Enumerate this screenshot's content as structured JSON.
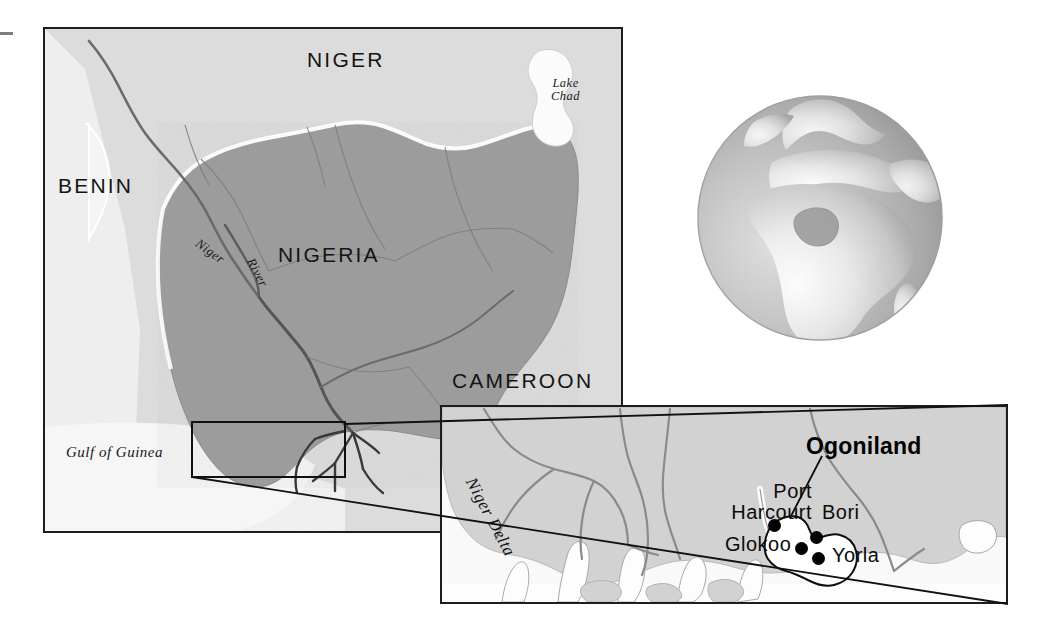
{
  "figure": {
    "kind": "reference-map",
    "width": 1054,
    "height": 639,
    "background": "#ffffff"
  },
  "colors": {
    "highlight_country_fill": "#9a9a9a",
    "neighbor_land_fill": "#d9d9d9",
    "water_fill": "#f4f4f4",
    "inset_land_fill": "#d2d2d2",
    "inset_water_fill": "#ffffff",
    "frame_stroke": "#1d1d1d",
    "border_stroke": "#6f6f6f",
    "river_stroke": "#555555",
    "coast_stroke": "#ffffff",
    "marker_fill": "#000000",
    "globe_ocean": "#a8a8a8",
    "globe_land": "#dcdcdc",
    "globe_highlight": "#8f8f8f"
  },
  "main_map": {
    "name": "nigeria-regional-map",
    "frame": {
      "x": 43,
      "y": 27,
      "w": 580,
      "h": 506
    },
    "country_labels": [
      {
        "id": "niger",
        "text": "NIGER",
        "x": 307,
        "y": 56
      },
      {
        "id": "benin",
        "text": "BENIN",
        "x": 58,
        "y": 182
      },
      {
        "id": "nigeria",
        "text": "NIGERIA",
        "x": 278,
        "y": 251
      },
      {
        "id": "cameroon",
        "text": "CAMEROON",
        "x": 452,
        "y": 377
      }
    ],
    "water_labels": [
      {
        "id": "lake-chad",
        "text": "Lake\nChad",
        "x": 551,
        "y": 80
      },
      {
        "id": "gulf-of-guinea",
        "text": "Gulf of Guinea",
        "x": 66,
        "y": 452
      }
    ],
    "river_labels": [
      {
        "id": "niger-word",
        "text": "Niger",
        "x": 197,
        "y": 241,
        "rotate": 36
      },
      {
        "id": "river-word",
        "text": "River",
        "x": 250,
        "y": 258,
        "rotate": 62
      }
    ],
    "inset_selection_box": {
      "x": 192,
      "y": 422,
      "w": 153,
      "h": 55
    }
  },
  "globe": {
    "name": "locator-globe",
    "frame": {
      "x": 694,
      "y": 92,
      "d": 252
    },
    "highlight_region": "Nigeria",
    "view": "Africa, Europe and Middle East"
  },
  "inset_map": {
    "name": "niger-delta-ogoniland-inset",
    "frame": {
      "x": 440,
      "y": 405,
      "w": 568,
      "h": 199
    },
    "region_label": {
      "id": "ogoniland",
      "text": "Ogoniland",
      "x": 806,
      "y": 445
    },
    "delta_label": {
      "id": "niger-delta",
      "text": "Niger Delta",
      "x": 470,
      "y": 478,
      "rotate": 62
    },
    "places": [
      {
        "id": "port-harcourt",
        "text": "Port\nHarcourt",
        "label_x": 672,
        "label_y": 487,
        "dot_x": 770,
        "dot_y": 521,
        "dot_r": 6
      },
      {
        "id": "bori",
        "text": "Bori",
        "label_x": 820,
        "label_y": 506,
        "dot_x": 812,
        "dot_y": 535,
        "dot_r": 6
      },
      {
        "id": "glokoo",
        "text": "Glokoo",
        "label_x": 727,
        "label_y": 538,
        "dot_x": 797,
        "dot_y": 546,
        "dot_r": 6
      },
      {
        "id": "yorla",
        "text": "Yorla",
        "label_x": 830,
        "label_y": 549,
        "dot_x": 814,
        "dot_y": 556,
        "dot_r": 6
      }
    ],
    "leader_line": {
      "from_x": 822,
      "from_y": 456,
      "to_x": 790,
      "to_y": 518
    }
  },
  "connector_lines": [
    {
      "id": "connector-top",
      "x1": 345,
      "y1": 424,
      "x2": 1008,
      "y2": 405
    },
    {
      "id": "connector-bottom",
      "x1": 192,
      "y1": 477,
      "x2": 1008,
      "y2": 604
    }
  ]
}
